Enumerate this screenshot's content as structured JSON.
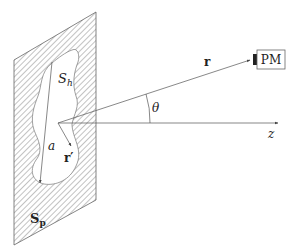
{
  "diagram": {
    "type": "physics-schematic",
    "labels": {
      "hole_surface": "S",
      "hole_surface_sub": "h",
      "plate_surface": "S",
      "plate_surface_sub": "p",
      "aperture_size": "a",
      "source_position": "r′",
      "observation_vector": "r",
      "angle": "θ",
      "axis": "z",
      "detector": "PM"
    },
    "colors": {
      "line": "#555555",
      "hatch": "#666666",
      "text": "#222222",
      "detector_window": "#222222"
    }
  }
}
